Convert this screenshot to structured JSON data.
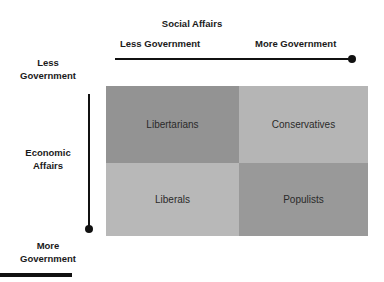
{
  "diagram": {
    "social_axis": {
      "title": "Social Affairs",
      "left_label": "Less Government",
      "right_label": "More Government"
    },
    "economic_axis": {
      "title_line1": "Economic",
      "title_line2": "Affairs",
      "top_label_line1": "Less",
      "top_label_line2": "Government",
      "bottom_label_line1": "More",
      "bottom_label_line2": "Government"
    },
    "quadrants": [
      {
        "label": "Libertarians",
        "color": "#939393"
      },
      {
        "label": "Conservatives",
        "color": "#b5b5b5"
      },
      {
        "label": "Liberals",
        "color": "#b8b8b8"
      },
      {
        "label": "Populists",
        "color": "#999999"
      }
    ]
  }
}
